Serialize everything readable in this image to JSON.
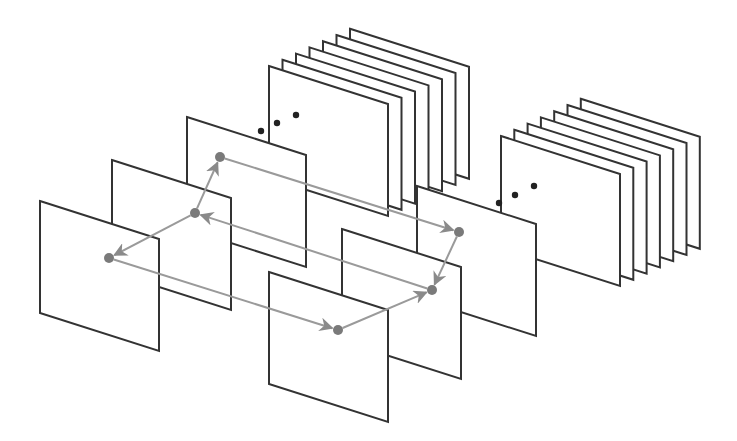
{
  "diagram": {
    "type": "layered-planes-graph",
    "colors": {
      "background": "#ffffff",
      "plane_stroke": "#333333",
      "edge": "#9a9a9a",
      "node": "#7a7a7a",
      "ellipsis": "#222222"
    },
    "plane_size": {
      "width": 119,
      "height": 112,
      "skew": 38
    },
    "stacks": [
      {
        "id": "top-stack",
        "front_origin": [
          269,
          66
        ],
        "count": 7,
        "offset": [
          13.5,
          -6.2
        ],
        "ellipsis_dots": [
          [
            261,
            131
          ],
          [
            277,
            123
          ],
          [
            296,
            115
          ]
        ]
      },
      {
        "id": "right-stack",
        "front_origin": [
          501,
          136
        ],
        "count": 7,
        "offset": [
          13.3,
          -6.2
        ],
        "ellipsis_dots": [
          [
            499,
            203
          ],
          [
            515,
            195
          ],
          [
            534,
            186
          ]
        ]
      }
    ],
    "planes": [
      {
        "id": "C",
        "origin": [
          187,
          117
        ]
      },
      {
        "id": "B",
        "origin": [
          112,
          160
        ]
      },
      {
        "id": "A",
        "origin": [
          40,
          201
        ]
      },
      {
        "id": "F",
        "origin": [
          417,
          186
        ]
      },
      {
        "id": "E",
        "origin": [
          342,
          229
        ]
      },
      {
        "id": "D",
        "origin": [
          269,
          272
        ]
      }
    ],
    "nodes": [
      {
        "id": "A",
        "pos": [
          109,
          258
        ]
      },
      {
        "id": "B",
        "pos": [
          195,
          213
        ]
      },
      {
        "id": "C",
        "pos": [
          220,
          157
        ]
      },
      {
        "id": "D",
        "pos": [
          338,
          330
        ]
      },
      {
        "id": "E",
        "pos": [
          432,
          290
        ]
      },
      {
        "id": "F",
        "pos": [
          459,
          232
        ]
      }
    ],
    "edges": [
      {
        "from": "C",
        "to": "F"
      },
      {
        "from": "F",
        "to": "E"
      },
      {
        "from": "D",
        "to": "E"
      },
      {
        "from": "E",
        "to": "B"
      },
      {
        "from": "B",
        "to": "C"
      },
      {
        "from": "B",
        "to": "A"
      },
      {
        "from": "A",
        "to": "D"
      }
    ]
  }
}
